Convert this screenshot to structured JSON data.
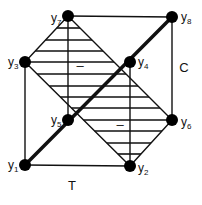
{
  "diagram": {
    "title": "",
    "colors": {
      "line": "#111111",
      "background": "#ffffff",
      "node": "#000000"
    },
    "vertices": [
      {
        "id": "y1",
        "base": "y",
        "sub": "1",
        "x": 25,
        "y": 165,
        "label_dx": -17,
        "label_dy": 4
      },
      {
        "id": "y2",
        "base": "y",
        "sub": "2",
        "x": 130,
        "y": 166,
        "label_dx": 8,
        "label_dy": 6
      },
      {
        "id": "y3",
        "base": "y",
        "sub": "3",
        "x": 25,
        "y": 62,
        "label_dx": -17,
        "label_dy": 4
      },
      {
        "id": "y4",
        "base": "y",
        "sub": "4",
        "x": 130,
        "y": 62,
        "label_dx": 8,
        "label_dy": 4
      },
      {
        "id": "y5",
        "base": "y",
        "sub": "5",
        "x": 68,
        "y": 120,
        "label_dx": -17,
        "label_dy": 4
      },
      {
        "id": "y6",
        "base": "y",
        "sub": "6",
        "x": 172,
        "y": 120,
        "label_dx": 9,
        "label_dy": 6
      },
      {
        "id": "y7",
        "base": "y",
        "sub": "7",
        "x": 68,
        "y": 16,
        "label_dx": -17,
        "label_dy": 6
      },
      {
        "id": "y8",
        "base": "y",
        "sub": "8",
        "x": 172,
        "y": 17,
        "label_dx": 9,
        "label_dy": 4
      }
    ],
    "edges": [
      {
        "from": "y7",
        "to": "y8",
        "weight": "thin"
      },
      {
        "from": "y3",
        "to": "y1",
        "weight": "thin"
      },
      {
        "from": "y1",
        "to": "y2",
        "weight": "thin"
      },
      {
        "from": "y8",
        "to": "y6",
        "weight": "thin"
      },
      {
        "from": "y7",
        "to": "y5",
        "weight": "thin"
      },
      {
        "from": "y4",
        "to": "y2",
        "weight": "thin"
      },
      {
        "from": "y7",
        "to": "y3",
        "weight": "thin"
      },
      {
        "from": "y7",
        "to": "y6",
        "weight": "thin"
      },
      {
        "from": "y3",
        "to": "y2",
        "weight": "thin"
      },
      {
        "from": "y2",
        "to": "y6",
        "weight": "thin"
      },
      {
        "from": "y1",
        "to": "y8",
        "weight": "thick"
      }
    ],
    "hatched_region": {
      "polygon": [
        "y7",
        "y3",
        "y2",
        "y6"
      ],
      "hatch": "horizontal",
      "line_ys": [
        28,
        40,
        51,
        62,
        74,
        86,
        97,
        108,
        120,
        131,
        143,
        154
      ]
    },
    "sign_marks": [
      {
        "text": "–",
        "x": 80,
        "y": 70
      },
      {
        "text": "–",
        "x": 120,
        "y": 129
      }
    ],
    "axis_labels": {
      "C": {
        "text": "C",
        "x": 184,
        "y": 72
      },
      "T": {
        "text": "T",
        "x": 72,
        "y": 190
      }
    }
  }
}
